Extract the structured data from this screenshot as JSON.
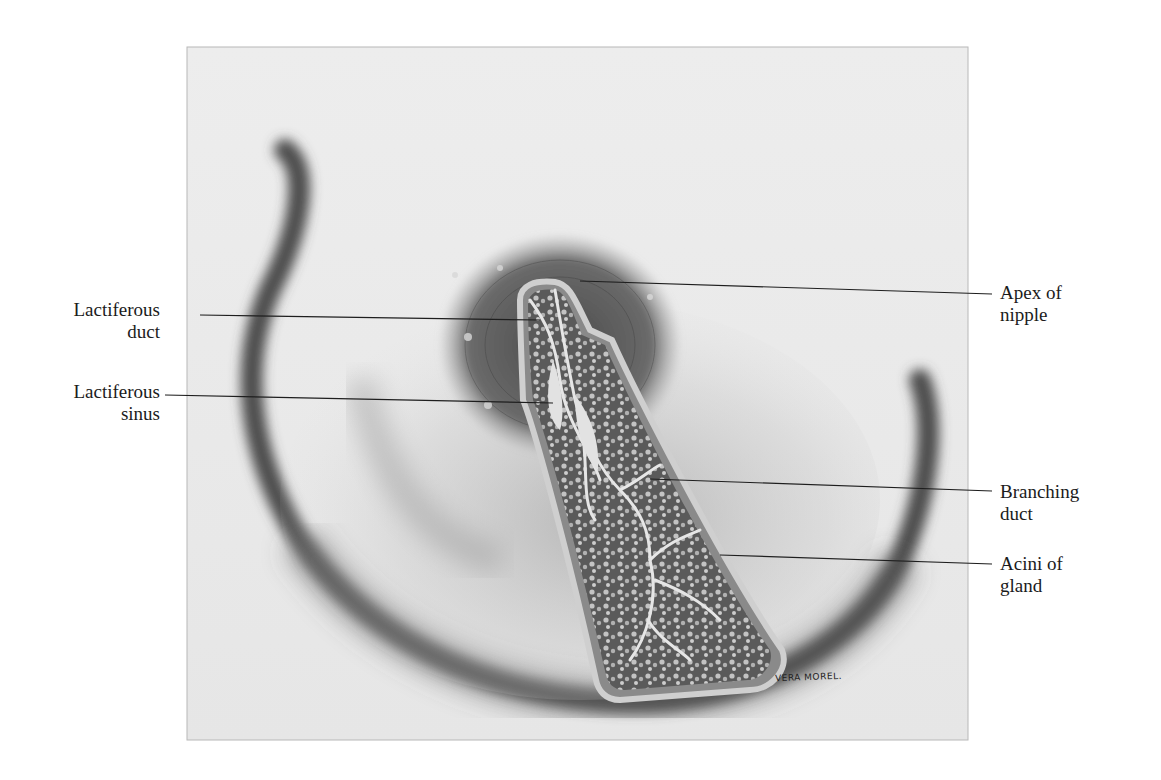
{
  "figure": {
    "colors": {
      "paper": "#ffffff",
      "plate_background": "#ebebeb",
      "skin_shadow": "#5a5a5a",
      "areola": "#6e6e6e",
      "gland_tissue": "#5c5c5c",
      "duct": "#dcdcdc",
      "leader_line": "#1e1e1e",
      "label_text": "#1b1b1b"
    }
  },
  "labels": {
    "left": [
      {
        "id": "lactiferous-duct",
        "line1": "Lactiferous",
        "line2": "duct"
      },
      {
        "id": "lactiferous-sinus",
        "line1": "Lactiferous",
        "line2": "sinus"
      }
    ],
    "right": [
      {
        "id": "apex-of-nipple",
        "line1": "Apex of",
        "line2": "nipple"
      },
      {
        "id": "branching-duct",
        "line1": "Branching",
        "line2": "duct"
      },
      {
        "id": "acini-of-gland",
        "line1": "Acini of",
        "line2": "gland"
      }
    ]
  },
  "signature": "VERA MOREL."
}
